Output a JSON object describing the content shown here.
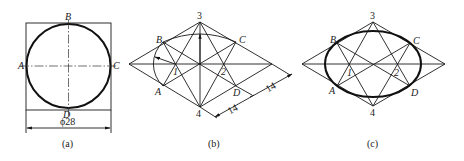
{
  "figure_a": {
    "caption": "(a)",
    "points": {
      "A": "A",
      "B": "B",
      "C": "C",
      "D": "D"
    },
    "dimension": "ϕ28"
  },
  "figure_b": {
    "caption": "(b)",
    "points": {
      "A": "A",
      "B": "B",
      "C": "C",
      "D": "D",
      "p1": "1",
      "p2": "2",
      "p3": "3",
      "p4": "4"
    },
    "dimensions": [
      "14",
      "14"
    ]
  },
  "figure_c": {
    "caption": "(c)",
    "points": {
      "A": "A",
      "B": "B",
      "C": "C",
      "D": "D",
      "p1": "1",
      "p2": "2",
      "p3": "3",
      "p4": "4"
    }
  },
  "colors": {
    "ink": "#1a1a1a",
    "background": "#ffffff"
  }
}
